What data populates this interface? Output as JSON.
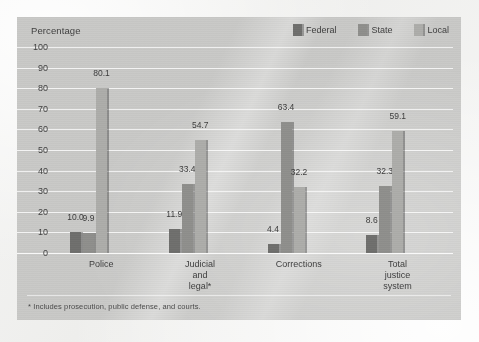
{
  "chart_data": {
    "type": "bar",
    "title": "",
    "axis_title": "Percentage",
    "xlabel": "",
    "ylabel": "Percentage",
    "ylim": [
      0,
      100
    ],
    "ytick_step": 10,
    "yticks": [
      "100",
      "90",
      "80",
      "70",
      "60",
      "50",
      "40",
      "30",
      "20",
      "10",
      "0"
    ],
    "grid": true,
    "legend_position": "top-right",
    "categories": [
      "Police",
      "Judicial and legal*",
      "Corrections",
      "Total justice system"
    ],
    "category_lines": [
      [
        "Police"
      ],
      [
        "Judicial",
        "and",
        "legal*"
      ],
      [
        "Corrections"
      ],
      [
        "Total",
        "justice",
        "system"
      ]
    ],
    "series": [
      {
        "name": "Federal",
        "color": "#6f6f6d",
        "values": [
          10.0,
          11.9,
          4.4,
          8.6
        ],
        "labels": [
          "10.0",
          "11.9",
          "4.4",
          "8.6"
        ]
      },
      {
        "name": "State",
        "color": "#8f8f8c",
        "values": [
          9.9,
          33.4,
          63.4,
          32.3
        ],
        "labels": [
          "9.9",
          "33.4",
          "63.4",
          "32.3"
        ]
      },
      {
        "name": "Local",
        "color": "#adadaa",
        "values": [
          80.1,
          54.7,
          32.2,
          59.1
        ],
        "labels": [
          "80.1",
          "54.7",
          "32.2",
          "59.1"
        ]
      }
    ],
    "footnote": "* Includes prosecution, public defense, and courts.",
    "colors": {
      "panel_background": "#c9c9c7",
      "page_background": "#f2f2f1",
      "gridline": "#ffffff",
      "text": "#3d3d3d",
      "federal": "#6f6f6d",
      "state": "#8f8f8c",
      "local": "#adadaa"
    }
  }
}
